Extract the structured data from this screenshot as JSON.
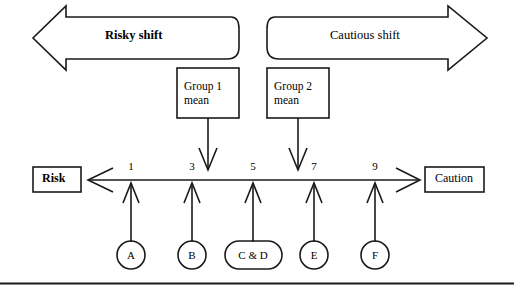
{
  "diagram": {
    "title_left_arrow": "Risky shift",
    "title_right_arrow": "Cautious shift",
    "group_boxes": [
      {
        "id": "group-1",
        "line1": "Group 1",
        "line2": "mean",
        "points_to": 4
      },
      {
        "id": "group-2",
        "line1": "Group 2",
        "line2": "mean",
        "points_to": 6
      }
    ],
    "axis": {
      "left_endpoint_label": "Risk",
      "right_endpoint_label": "Caution",
      "ticks": [
        "1",
        "3",
        "5",
        "7",
        "9"
      ],
      "tick_values": [
        1,
        3,
        5,
        7,
        9
      ],
      "range_min": 0,
      "range_max": 10
    },
    "items": [
      {
        "label": "A",
        "value": 1,
        "shape": "circle"
      },
      {
        "label": "B",
        "value": 3,
        "shape": "circle"
      },
      {
        "label": "C & D",
        "value": 5,
        "shape": "oval"
      },
      {
        "label": "E",
        "value": 7,
        "shape": "circle"
      },
      {
        "label": "F",
        "value": 9,
        "shape": "circle"
      }
    ],
    "colors": {
      "stroke": "#1a1a1a",
      "background": "#ffffff"
    }
  }
}
